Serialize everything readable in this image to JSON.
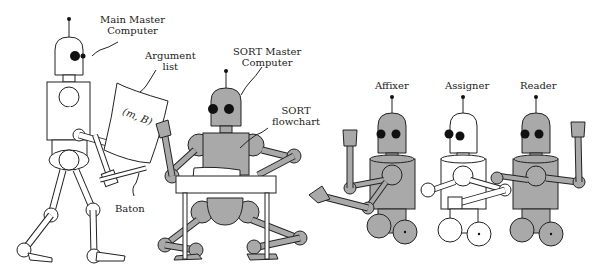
{
  "labels": {
    "main_master": [
      "Main Master",
      "Computer"
    ],
    "argument_list": [
      "Argument",
      "list"
    ],
    "sheet_text": "(m, B)",
    "baton": "Baton",
    "sort_master": [
      "SORT Master",
      "Computer"
    ],
    "sort_flowchart": [
      "SORT",
      "flowchart"
    ],
    "affixer": "Affixer",
    "assigner": "Assigner",
    "reader": "Reader"
  },
  "colors": {
    "robot_gray": "#a9a9a9",
    "robot_white": "#ffffff",
    "outline": "#222222",
    "background": "#ffffff"
  }
}
